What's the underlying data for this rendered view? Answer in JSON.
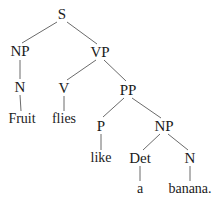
{
  "diagram": {
    "sentence": "Fruit flies like a banana.",
    "type": "constituency-tree",
    "style": {
      "background": "#ffffff",
      "text_color": "#1b1b1b",
      "edge_color": "#6b6b6b",
      "edge_width": 1
    },
    "nodes": [
      {
        "id": "S",
        "label": "S",
        "kind": "category",
        "x": 62,
        "y": 14
      },
      {
        "id": "NP1",
        "label": "NP",
        "kind": "category",
        "x": 20,
        "y": 51
      },
      {
        "id": "VP",
        "label": "VP",
        "kind": "category",
        "x": 100,
        "y": 52
      },
      {
        "id": "N1",
        "label": "N",
        "kind": "category",
        "x": 20,
        "y": 87
      },
      {
        "id": "V",
        "label": "V",
        "kind": "category",
        "x": 64,
        "y": 88
      },
      {
        "id": "PP",
        "label": "PP",
        "kind": "category",
        "x": 128,
        "y": 90
      },
      {
        "id": "Fruit",
        "label": "Fruit",
        "kind": "terminal",
        "x": 22,
        "y": 119
      },
      {
        "id": "flies",
        "label": "flies",
        "kind": "terminal",
        "x": 64,
        "y": 119
      },
      {
        "id": "P",
        "label": "P",
        "kind": "category",
        "x": 101,
        "y": 126
      },
      {
        "id": "NP2",
        "label": "NP",
        "kind": "category",
        "x": 164,
        "y": 126
      },
      {
        "id": "like",
        "label": "like",
        "kind": "terminal",
        "x": 101,
        "y": 158
      },
      {
        "id": "Det",
        "label": "Det",
        "kind": "category",
        "x": 140,
        "y": 158
      },
      {
        "id": "N2",
        "label": "N",
        "kind": "category",
        "x": 190,
        "y": 158
      },
      {
        "id": "a",
        "label": "a",
        "kind": "terminal",
        "x": 140,
        "y": 189
      },
      {
        "id": "banana",
        "label": "banana.",
        "kind": "terminal",
        "x": 190,
        "y": 189
      }
    ],
    "edges": [
      {
        "from": "S",
        "to": "NP1",
        "x1": 57,
        "y1": 22,
        "x2": 22,
        "y2": 43
      },
      {
        "from": "S",
        "to": "VP",
        "x1": 67,
        "y1": 22,
        "x2": 97,
        "y2": 44
      },
      {
        "from": "NP1",
        "to": "N1",
        "x1": 20,
        "y1": 60,
        "x2": 20,
        "y2": 79
      },
      {
        "from": "N1",
        "to": "Fruit",
        "x1": 20,
        "y1": 95,
        "x2": 21,
        "y2": 111
      },
      {
        "from": "VP",
        "to": "V",
        "x1": 96,
        "y1": 60,
        "x2": 67,
        "y2": 80
      },
      {
        "from": "VP",
        "to": "PP",
        "x1": 104,
        "y1": 60,
        "x2": 126,
        "y2": 81
      },
      {
        "from": "V",
        "to": "flies",
        "x1": 64,
        "y1": 96,
        "x2": 64,
        "y2": 111
      },
      {
        "from": "PP",
        "to": "P",
        "x1": 124,
        "y1": 98,
        "x2": 103,
        "y2": 117
      },
      {
        "from": "PP",
        "to": "NP2",
        "x1": 132,
        "y1": 98,
        "x2": 161,
        "y2": 118
      },
      {
        "from": "P",
        "to": "like",
        "x1": 101,
        "y1": 134,
        "x2": 101,
        "y2": 150
      },
      {
        "from": "NP2",
        "to": "Det",
        "x1": 160,
        "y1": 134,
        "x2": 143,
        "y2": 150
      },
      {
        "from": "NP2",
        "to": "N2",
        "x1": 168,
        "y1": 134,
        "x2": 188,
        "y2": 150
      },
      {
        "from": "Det",
        "to": "a",
        "x1": 140,
        "y1": 166,
        "x2": 140,
        "y2": 181
      },
      {
        "from": "N2",
        "to": "banana",
        "x1": 190,
        "y1": 166,
        "x2": 190,
        "y2": 181
      }
    ]
  }
}
